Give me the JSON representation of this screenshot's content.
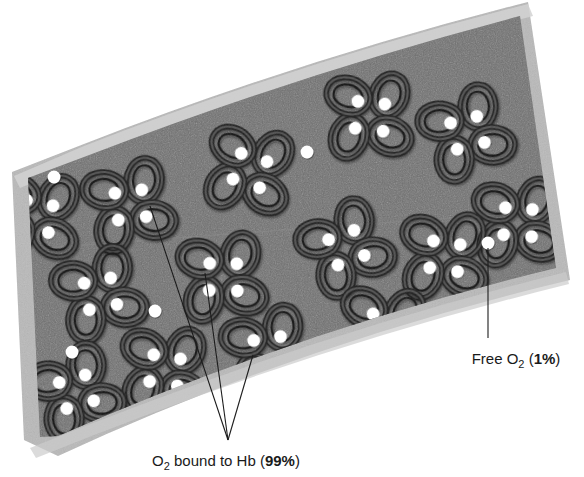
{
  "figure": {
    "colors": {
      "vessel_wall": "#b9b9b9",
      "vessel_wall_highlight": "#cfcfcf",
      "plasma": "#6f6f6f",
      "plasma_dark": "#636363",
      "hemoglobin_outline": "#2b2b2b",
      "hemoglobin_fill": "#4a4a4a",
      "oxygen_dot": "#ffffff",
      "leader_line": "#1c1c1c",
      "label_text": "#1a1a1a",
      "background": "#ffffff"
    }
  },
  "labels": {
    "bound": {
      "name": "bound-oxygen-label",
      "prefix": "O",
      "subscript": "2",
      "middle": " bound to Hb (",
      "value": "99%",
      "suffix": ")",
      "full_text": "O2 bound to Hb (99%)"
    },
    "free": {
      "name": "free-oxygen-label",
      "prefix": "Free O",
      "subscript": "2",
      "middle": " (",
      "value": "1%",
      "suffix": ")",
      "full_text": "Free O2 (1%)"
    }
  },
  "icons": {
    "hemoglobin": "hemoglobin-molecule-icon",
    "oxygen": "oxygen-dot-icon",
    "vessel": "blood-vessel-icon",
    "leader": "leader-line-icon"
  },
  "diagram_data": {
    "type": "illustration",
    "hemoglobin_molecules": [
      {
        "cx": 369,
        "cy": 116,
        "r": 30,
        "rot": 8
      },
      {
        "cx": 466,
        "cy": 133,
        "r": 30,
        "rot": -12
      },
      {
        "cx": 249,
        "cy": 170,
        "r": 30,
        "rot": 20
      },
      {
        "cx": 129,
        "cy": 205,
        "r": 30,
        "rot": -5
      },
      {
        "cx": 36,
        "cy": 216,
        "r": 29,
        "rot": 14
      },
      {
        "cx": 517,
        "cy": 222,
        "r": 29,
        "rot": 6
      },
      {
        "cx": 345,
        "cy": 248,
        "r": 30,
        "rot": -18
      },
      {
        "cx": 444,
        "cy": 256,
        "r": 30,
        "rot": 10
      },
      {
        "cx": 222,
        "cy": 277,
        "r": 30,
        "rot": 3
      },
      {
        "cx": 99,
        "cy": 294,
        "r": 30,
        "rot": -9
      },
      {
        "cx": 382,
        "cy": 330,
        "r": 30,
        "rot": 16
      },
      {
        "cx": 268,
        "cy": 352,
        "r": 30,
        "rot": -6
      },
      {
        "cx": 164,
        "cy": 370,
        "r": 30,
        "rot": 11
      },
      {
        "cx": 75,
        "cy": 392,
        "r": 29,
        "rot": -14
      }
    ],
    "free_oxygen_dots": [
      {
        "cx": 307,
        "cy": 152,
        "r": 6
      },
      {
        "cx": 54,
        "cy": 177,
        "r": 6
      },
      {
        "cx": 488,
        "cy": 243,
        "r": 6
      },
      {
        "cx": 155,
        "cy": 311,
        "r": 6
      },
      {
        "cx": 318,
        "cy": 343,
        "r": 6
      },
      {
        "cx": 72,
        "cy": 352,
        "r": 6
      }
    ],
    "leader_lines": {
      "bound": {
        "converge": {
          "x": 228,
          "y": 440
        },
        "targets": [
          {
            "x": 150,
            "y": 206
          },
          {
            "x": 205,
            "y": 273
          },
          {
            "x": 253,
            "y": 355
          }
        ]
      },
      "free": {
        "from": {
          "x": 488,
          "y": 248
        },
        "to": {
          "x": 488,
          "y": 338
        }
      }
    },
    "vessel_outline": {
      "wall_thickness": 12,
      "shape": "curved-band"
    }
  }
}
